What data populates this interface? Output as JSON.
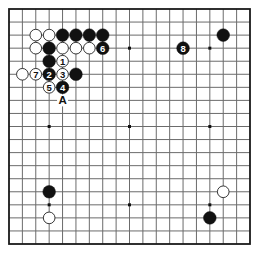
{
  "board": {
    "size": 19,
    "origin_x": 9,
    "origin_y": 9,
    "end_x": 250,
    "end_y": 244,
    "background": "#ffffff",
    "line_color": "#6b6b6b",
    "border_color": "#1a1a1a",
    "star_points": [
      [
        3,
        3
      ],
      [
        9,
        3
      ],
      [
        15,
        3
      ],
      [
        3,
        9
      ],
      [
        9,
        9
      ],
      [
        15,
        9
      ],
      [
        3,
        15
      ],
      [
        9,
        15
      ],
      [
        15,
        15
      ]
    ]
  },
  "colors": {
    "black_stone": "#111111",
    "white_stone": "#ffffff",
    "white_stone_outline": "#222222",
    "label_on_black": "#ffffff",
    "label_on_white": "#111111",
    "marker_text": "#111111"
  },
  "stones": [
    {
      "color": "white",
      "col": 2,
      "row": 2,
      "label": ""
    },
    {
      "color": "white",
      "col": 3,
      "row": 2,
      "label": ""
    },
    {
      "color": "black",
      "col": 4,
      "row": 2,
      "label": ""
    },
    {
      "color": "black",
      "col": 5,
      "row": 2,
      "label": ""
    },
    {
      "color": "black",
      "col": 6,
      "row": 2,
      "label": ""
    },
    {
      "color": "black",
      "col": 7,
      "row": 2,
      "label": ""
    },
    {
      "color": "white",
      "col": 2,
      "row": 3,
      "label": ""
    },
    {
      "color": "black",
      "col": 3,
      "row": 3,
      "label": ""
    },
    {
      "color": "white",
      "col": 4,
      "row": 3,
      "label": ""
    },
    {
      "color": "white",
      "col": 5,
      "row": 3,
      "label": ""
    },
    {
      "color": "white",
      "col": 6,
      "row": 3,
      "label": ""
    },
    {
      "color": "black",
      "col": 7,
      "row": 3,
      "label": "6"
    },
    {
      "color": "black",
      "col": 3,
      "row": 4,
      "label": ""
    },
    {
      "color": "white",
      "col": 4,
      "row": 4,
      "label": "1"
    },
    {
      "color": "white",
      "col": 1,
      "row": 5,
      "label": ""
    },
    {
      "color": "white",
      "col": 2,
      "row": 5,
      "label": "7"
    },
    {
      "color": "black",
      "col": 3,
      "row": 5,
      "label": "2"
    },
    {
      "color": "white",
      "col": 4,
      "row": 5,
      "label": "3"
    },
    {
      "color": "black",
      "col": 5,
      "row": 5,
      "label": ""
    },
    {
      "color": "white",
      "col": 3,
      "row": 6,
      "label": "5"
    },
    {
      "color": "black",
      "col": 4,
      "row": 6,
      "label": "4"
    },
    {
      "color": "black",
      "col": 13,
      "row": 3,
      "label": "8"
    },
    {
      "color": "black",
      "col": 16,
      "row": 2,
      "label": ""
    },
    {
      "color": "black",
      "col": 3,
      "row": 14,
      "label": ""
    },
    {
      "color": "white",
      "col": 3,
      "row": 16,
      "label": ""
    },
    {
      "color": "white",
      "col": 16,
      "row": 14,
      "label": ""
    },
    {
      "color": "black",
      "col": 15,
      "row": 16,
      "label": ""
    }
  ],
  "markers": [
    {
      "col": 4,
      "row": 7,
      "text": "A"
    }
  ]
}
